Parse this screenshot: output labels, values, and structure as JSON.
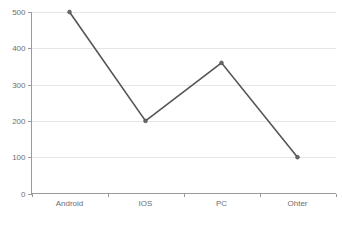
{
  "chart_data": {
    "type": "line",
    "title": "",
    "xlabel": "",
    "ylabel": "",
    "categories": [
      "Android",
      "IOS",
      "PC",
      "Ohter"
    ],
    "values": [
      500,
      200,
      360,
      100
    ],
    "series": [
      {
        "name": "",
        "values": [
          500,
          200,
          360,
          100
        ]
      }
    ],
    "ylim": [
      0,
      500
    ],
    "yticks": [
      0,
      100,
      200,
      300,
      400,
      500
    ],
    "ytick_labels": [
      "0",
      "100",
      "200",
      "300",
      "400",
      "500"
    ],
    "grid": true,
    "grid_axis": "y",
    "legend": false,
    "legend_position": "none",
    "markers": true,
    "colors": {
      "line": "#555555",
      "marker": "#6a6a6a",
      "grid": "#e6e6e6",
      "axis": "#9a9a9a",
      "tick_text": "#6e6e6e",
      "background": "#ffffff"
    }
  }
}
